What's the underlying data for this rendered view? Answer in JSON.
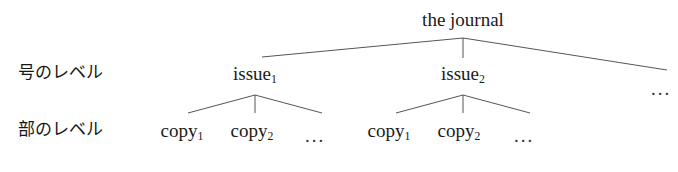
{
  "figure": {
    "type": "tree-diagram",
    "background_color": "#ffffff",
    "line_color": "#555555",
    "text_color": "#1a1a1a",
    "width": 678,
    "height": 172
  },
  "row_labels": [
    {
      "id": "issue-level",
      "text": "号のレベル",
      "x": 18,
      "y": 64
    },
    {
      "id": "copy-level",
      "text": "部のレベル",
      "x": 18,
      "y": 121
    }
  ],
  "nodes": {
    "root": {
      "id": "the-journal",
      "label": "the journal",
      "x": 463,
      "y": 10
    },
    "issues": [
      {
        "id": "issue-1",
        "label": "issue",
        "sub": "1",
        "x": 255,
        "y": 64
      },
      {
        "id": "issue-2",
        "label": "issue",
        "sub": "2",
        "x": 463,
        "y": 64
      }
    ],
    "copies": [
      {
        "id": "issue-1-copy-1",
        "label": "copy",
        "sub": "1",
        "x": 182,
        "y": 121
      },
      {
        "id": "issue-1-copy-2",
        "label": "copy",
        "sub": "2",
        "x": 252,
        "y": 121
      },
      {
        "id": "issue-2-copy-1",
        "label": "copy",
        "sub": "1",
        "x": 389,
        "y": 121
      },
      {
        "id": "issue-2-copy-2",
        "label": "copy",
        "sub": "2",
        "x": 459,
        "y": 121
      }
    ]
  },
  "ellipses": [
    {
      "id": "issue-level-ellipsis",
      "text": "...",
      "x": 661,
      "y": 78
    },
    {
      "id": "issue-1-copies-ellipsis",
      "text": "...",
      "x": 315,
      "y": 125
    },
    {
      "id": "issue-2-copies-ellipsis",
      "text": "...",
      "x": 524,
      "y": 125
    }
  ],
  "edges": [
    {
      "id": "root-to-issue-1",
      "x1": 463,
      "y1": 38,
      "x2": 262,
      "y2": 57
    },
    {
      "id": "root-to-issue-2",
      "x1": 463,
      "y1": 38,
      "x2": 463,
      "y2": 58
    },
    {
      "id": "root-to-issue-ellipsis",
      "x1": 463,
      "y1": 38,
      "x2": 667,
      "y2": 70
    },
    {
      "id": "issue-1-to-copy-1",
      "x1": 255,
      "y1": 95,
      "x2": 188,
      "y2": 113
    },
    {
      "id": "issue-1-to-copy-2",
      "x1": 255,
      "y1": 95,
      "x2": 255,
      "y2": 113
    },
    {
      "id": "issue-1-to-copy-ellipsis",
      "x1": 255,
      "y1": 95,
      "x2": 322,
      "y2": 113
    },
    {
      "id": "issue-2-to-copy-1",
      "x1": 463,
      "y1": 95,
      "x2": 396,
      "y2": 113
    },
    {
      "id": "issue-2-to-copy-2",
      "x1": 463,
      "y1": 95,
      "x2": 463,
      "y2": 113
    },
    {
      "id": "issue-2-to-copy-ellipsis",
      "x1": 463,
      "y1": 95,
      "x2": 530,
      "y2": 113
    }
  ]
}
